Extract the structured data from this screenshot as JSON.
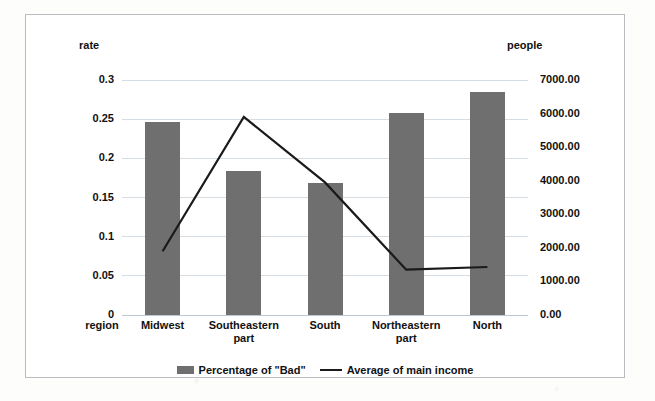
{
  "chart_data": {
    "type": "bar",
    "combo": "bar + line (dual axis)",
    "categories": [
      "Midwest",
      "Southeastern part",
      "South",
      "Northeastern part",
      "North"
    ],
    "series": [
      {
        "name": "Percentage of \"Bad\"",
        "type": "bar",
        "axis": "left",
        "values": [
          0.246,
          0.184,
          0.168,
          0.258,
          0.285
        ]
      },
      {
        "name": "Average of main income",
        "type": "line",
        "axis": "right",
        "values": [
          1900.0,
          5900.0,
          3950.0,
          1350.0,
          1430.0
        ]
      }
    ],
    "title": "",
    "xlabel": "region",
    "ylabel": "rate",
    "y2label": "people",
    "ylim": [
      0,
      0.3
    ],
    "y2lim": [
      0,
      7000
    ],
    "yticks": [
      "0",
      "0.05",
      "0.1",
      "0.15",
      "0.2",
      "0.25",
      "0.3"
    ],
    "ytick_values": [
      0,
      0.05,
      0.1,
      0.15,
      0.2,
      0.25,
      0.3
    ],
    "y2ticks": [
      "0.00",
      "1000.00",
      "2000.00",
      "3000.00",
      "4000.00",
      "5000.00",
      "6000.00",
      "7000.00"
    ],
    "y2tick_values": [
      0,
      1000,
      2000,
      3000,
      4000,
      5000,
      6000,
      7000
    ],
    "grid": true,
    "legend_position": "bottom",
    "bar_color": "#6f6f6f",
    "line_color": "#1a1a1a",
    "grid_color": "#d6dde3",
    "plot_background": "#ffffff",
    "border_color": "#b9bcbe"
  },
  "legend": {
    "items": [
      {
        "label": "Percentage of \"Bad\"",
        "marker": "bar-swatch-icon"
      },
      {
        "label": "Average of main income",
        "marker": "line-marker-icon"
      }
    ]
  }
}
